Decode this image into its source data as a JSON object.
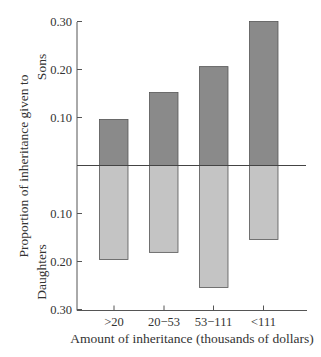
{
  "chart_data": {
    "type": "bar",
    "title": "",
    "xlabel": "Amount of inheritance (thousands of dollars)",
    "ylabel": "Proportion of inheritance given to",
    "ylabel_top_group": "Sons",
    "ylabel_bottom_group": "Daughters",
    "categories": [
      ">20",
      "20−53",
      "53−111",
      "<111"
    ],
    "series": [
      {
        "name": "Sons",
        "direction": "up",
        "color": "#8a8a8a",
        "values": [
          0.096,
          0.152,
          0.206,
          0.3
        ]
      },
      {
        "name": "Daughters",
        "direction": "down",
        "color": "#c4c4c4",
        "values": [
          0.196,
          0.181,
          0.254,
          0.154
        ]
      }
    ],
    "y_ticks_up": [
      "0.10",
      "0.20",
      "0.30"
    ],
    "y_ticks_down": [
      "0.10",
      "0.20",
      "0.30"
    ],
    "ylim": [
      0,
      0.3
    ],
    "grid": false,
    "legend": "none (group labels on y axis)"
  },
  "labels": {
    "xlabel": "Amount of inheritance (thousands of dollars)",
    "ylabel": "Proportion of inheritance given to",
    "sons": "Sons",
    "daughters": "Daughters"
  }
}
